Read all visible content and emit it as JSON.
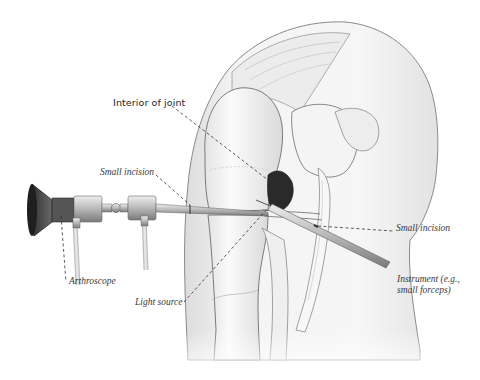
{
  "figure": {
    "colors": {
      "background": "#ffffff",
      "tissue_fill": "#f2f2f2",
      "tissue_shade": "#d9d9d9",
      "outline": "#6e6e6e",
      "dark_cavity": "#2a2a2a",
      "instrument_metal": "#a8a8a8",
      "scope_dark": "#3c3c3c",
      "leader_line": "#333333"
    }
  },
  "labels": {
    "interior_of_joint": "Interior of joint",
    "small_incision_left": "Small incision",
    "small_incision_right": "Small incision",
    "arthroscope": "Arthroscope",
    "light_source": "Light source",
    "instrument_line1": "Instrument (e.g.,",
    "instrument_line2": "small forceps)"
  }
}
